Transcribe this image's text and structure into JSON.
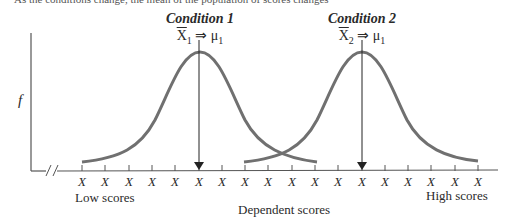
{
  "top_text": "As the conditions change, the mean of the population of scores changes",
  "conditions": [
    {
      "label": "Condition 1",
      "sample_mean": "X",
      "subscript": "1",
      "arrow": "⇒",
      "mu": "μ",
      "mu_subscript": "1",
      "center_x": 200
    },
    {
      "label": "Condition 2",
      "sample_mean": "X",
      "subscript": "2",
      "arrow": "⇒",
      "mu": "μ",
      "mu_subscript": "1",
      "center_x": 362
    }
  ],
  "y_axis_label": "f",
  "x_axis": {
    "title": "Dependent scores",
    "low_label": "Low scores",
    "high_label": "High scores",
    "tick_label": "X",
    "tick_count": 16,
    "break_symbol": "//"
  },
  "colors": {
    "curve": "#707070",
    "axis": "#555555",
    "arrow": "#222222",
    "text": "#2a2a2a"
  }
}
